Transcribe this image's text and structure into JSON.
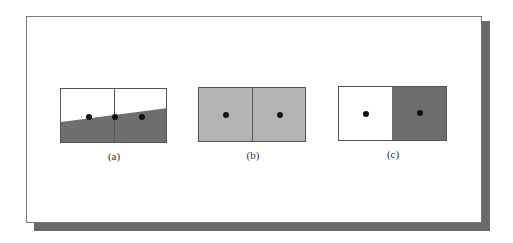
{
  "figure": {
    "panels": [
      {
        "id": "a",
        "caption": "(a)",
        "description": "two cells with sloped edge, lower region dark gray",
        "fill_upper": "#ffffff",
        "fill_lower": "#6e6e6e",
        "dots": 3
      },
      {
        "id": "b",
        "caption": "(b)",
        "description": "two cells uniformly light gray",
        "fill": "#b3b3b3",
        "dots": 2
      },
      {
        "id": "c",
        "caption": "(c)",
        "description": "left cell white, right cell dark gray",
        "fill_left": "#ffffff",
        "fill_right": "#6e6e6e",
        "dots": 2
      }
    ],
    "colors": {
      "shadow": "#6a6a6a",
      "border": "#555555",
      "dot": "#111111"
    }
  }
}
